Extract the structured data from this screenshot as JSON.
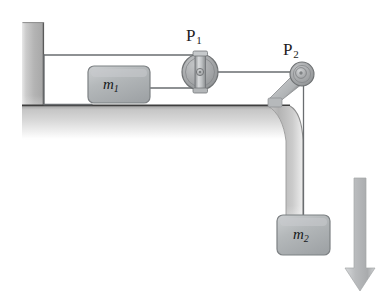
{
  "figure": {
    "background_color": "#ffffff",
    "width": 387,
    "height": 301
  },
  "labels": {
    "pulley_1": "P",
    "pulley_1_sub": "1",
    "pulley_2": "P",
    "pulley_2_sub": "2",
    "mass_1": "m",
    "mass_1_sub": "1",
    "mass_2": "m",
    "mass_2_sub": "2"
  },
  "colors": {
    "wall": "#b9b9b9",
    "table": "#c2c2c2",
    "table_edge_line": "#4a4a4a",
    "block_fill": "#b0b3b5",
    "block_stroke": "#7d8184",
    "pulley_fill": "#a8aaac",
    "pulley_stroke": "#6f7274",
    "string": "#6a6d70",
    "arrow": "#b5b7b9",
    "text": "#1d1d1d"
  },
  "elements": {
    "wall": {
      "name": "vertical-wall",
      "x": 22,
      "y": 22,
      "width": 22,
      "height": 118
    },
    "table": {
      "name": "horizontal-table-surface",
      "top_y": 105,
      "left_x": 22,
      "right_x": 290
    },
    "pulley_1": {
      "name": "pulley-P1",
      "cx": 200,
      "cy": 72,
      "radius": 18
    },
    "pulley_2": {
      "name": "pulley-P2",
      "cx": 302,
      "cy": 74,
      "radius": 12
    },
    "block_m1": {
      "name": "block-m1",
      "x": 88,
      "y": 66,
      "width": 62,
      "height": 37
    },
    "block_m2": {
      "name": "block-m2",
      "x": 277,
      "y": 215,
      "width": 53,
      "height": 40
    },
    "string_upper": {
      "name": "string-wall-to-P1-top",
      "from_x": 44,
      "from_y": 55,
      "to_x": 200,
      "to_y": 55
    },
    "string_wall_vertical": {
      "name": "string-wall-vertical",
      "x": 44,
      "from_y": 55,
      "to_y": 104
    },
    "string_lower": {
      "name": "string-wall-to-m1",
      "from_x": 44,
      "from_y": 104,
      "to_x": 88,
      "to_y": 104
    },
    "string_m1_to_P1": {
      "name": "string-m1-to-P1",
      "from_x": 150,
      "from_y": 88,
      "to_x": 200,
      "to_y": 88
    },
    "string_P1_to_P2": {
      "name": "string-P1-to-P2",
      "from_x": 200,
      "from_y": 72,
      "to_x": 302,
      "to_y": 72
    },
    "string_P2_to_m2": {
      "name": "string-P2-to-m2",
      "x": 303,
      "from_y": 80,
      "to_y": 216
    },
    "arrow_down": {
      "name": "downward-force-arrow",
      "x": 360,
      "from_y": 178,
      "to_y": 290,
      "shaft_width": 12,
      "head_width": 30
    }
  }
}
